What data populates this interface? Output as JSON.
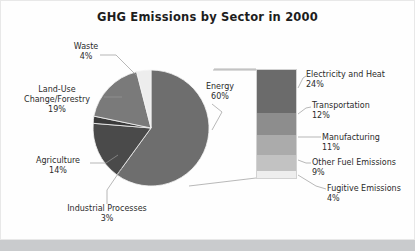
{
  "chart_data": {
    "type": "pie",
    "title": "GHG Emissions by Sector in 2000",
    "xlabel": "",
    "ylabel": "",
    "legend": "none",
    "grid": false,
    "categories": [
      "Energy",
      "Land-Use Change/Forestry",
      "Agriculture",
      "Waste",
      "Industrial Processes"
    ],
    "values": [
      60,
      19,
      14,
      4,
      3
    ],
    "labels": [
      {
        "name": "Energy",
        "pct": "60%",
        "value": 60,
        "color": "#6e6e6e"
      },
      {
        "name": "Land-Use Change/Forestry",
        "pct": "19%",
        "value": 19,
        "color": "#7a7a7a"
      },
      {
        "name": "Agriculture",
        "pct": "14%",
        "value": 14,
        "color": "#4a4a4a"
      },
      {
        "name": "Waste",
        "pct": "4%",
        "value": 4,
        "color": "#ededed"
      },
      {
        "name": "Industrial Processes",
        "pct": "3%",
        "value": 3,
        "color": "#3a3a3a"
      }
    ],
    "breakout": {
      "of_category": "Energy",
      "type": "stacked_bar",
      "segments": [
        {
          "name": "Electricity and Heat",
          "pct": "24%",
          "value": 24,
          "color": "#6b6b6b"
        },
        {
          "name": "Transportation",
          "pct": "12%",
          "value": 12,
          "color": "#8d8d8d"
        },
        {
          "name": "Manufacturing",
          "pct": "11%",
          "value": 11,
          "color": "#ababab"
        },
        {
          "name": "Other Fuel Emissions",
          "pct": "9%",
          "value": 9,
          "color": "#c2c2c2"
        },
        {
          "name": "Fugitive Emissions",
          "pct": "4%",
          "value": 4,
          "color": "#eeeeee"
        }
      ]
    }
  },
  "pie_labels": {
    "waste": {
      "name": "Waste",
      "pct": "4%"
    },
    "landuse": {
      "name": "Land-Use",
      "name2": "Change/Forestry",
      "pct": "19%"
    },
    "agri": {
      "name": "Agriculture",
      "pct": "14%"
    },
    "indproc": {
      "name": "Industrial Processes",
      "pct": "3%"
    },
    "energy": {
      "name": "Energy",
      "pct": "60%"
    }
  },
  "breakout_labels": {
    "elec": {
      "name": "Electricity and Heat",
      "pct": "24%"
    },
    "trans": {
      "name": "Transportation",
      "pct": "12%"
    },
    "manu": {
      "name": "Manufacturing",
      "pct": "11%"
    },
    "otherfuel": {
      "name": "Other Fuel Emissions",
      "pct": "9%"
    },
    "fugitive": {
      "name": "Fugitive Emissions",
      "pct": "4%"
    }
  },
  "colors": {
    "background": "#ffffff",
    "frame": "#e8e8e8",
    "bottom_band": "#c9cbcd",
    "text": "#2b2b2b",
    "title": "#1d1d1d",
    "leader_line": "#9a9a9a"
  }
}
